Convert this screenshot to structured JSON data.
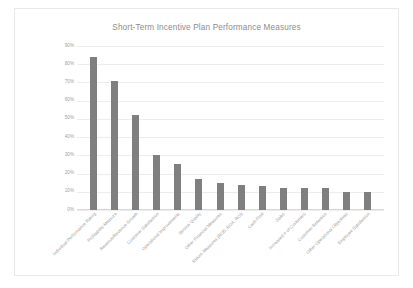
{
  "chart_data": {
    "type": "bar",
    "title": "Short-Term Incentive Plan Performance Measures",
    "xlabel": "",
    "ylabel": "",
    "ylim": [
      0,
      90
    ],
    "grid": true,
    "legend": "none",
    "bar_color": "#7f7f7f",
    "gridline_color": "#ededed",
    "text_color": "#9a9a9a",
    "ytick_labels": [
      "90%",
      "80%",
      "70%",
      "60%",
      "50%",
      "40%",
      "30%",
      "20%",
      "10%",
      "0%"
    ],
    "ytick_values": [
      90,
      80,
      70,
      60,
      50,
      40,
      30,
      20,
      10,
      0
    ],
    "categories": [
      "Individual Performance Rating",
      "Profitability Measure",
      "Revenue/Revenue Growth",
      "Customer Satisfaction",
      "Operational Improvements",
      "Service Quality",
      "Other Financial Measures",
      "Return Measures (ROE, ROA, ROI)",
      "Cash Flow",
      "Sales",
      "Increased # of Customers",
      "Customer Retention",
      "Other Operational Objectives",
      "Employee Satisfaction"
    ],
    "values": [
      84,
      71,
      52,
      30,
      25,
      17,
      15,
      14,
      13,
      12,
      12,
      12,
      10,
      10
    ]
  }
}
